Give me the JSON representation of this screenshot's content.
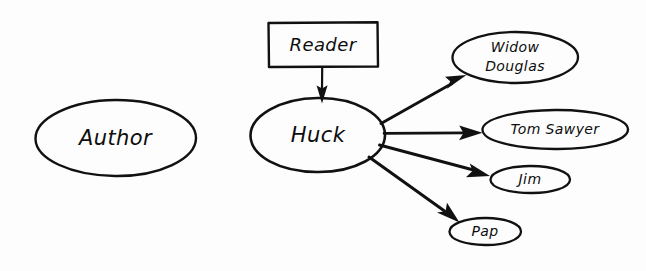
{
  "diagram": {
    "kind": "hand-drawn concept map",
    "background_color": "#fdfdfd",
    "ink_color": "#111111",
    "nodes": [
      {
        "id": "author",
        "label": "Author",
        "shape": "ellipse",
        "cx": 115.5,
        "cy": 138,
        "rx": 80,
        "ry": 38,
        "font_size": 21,
        "lines": [
          "Author"
        ]
      },
      {
        "id": "reader",
        "label": "Reader",
        "shape": "rectangle",
        "x": 268,
        "y": 22,
        "width": 110,
        "height": 45,
        "font_size": 18,
        "lines": [
          "Reader"
        ]
      },
      {
        "id": "huck",
        "label": "Huck",
        "shape": "ellipse",
        "cx": 317.5,
        "cy": 135,
        "rx": 67.5,
        "ry": 37,
        "font_size": 21,
        "lines": [
          "Huck"
        ]
      },
      {
        "id": "widow-douglas",
        "label": "Widow Douglas",
        "shape": "ellipse",
        "cx": 515,
        "cy": 57,
        "rx": 63,
        "ry": 26,
        "font_size": 14,
        "lines": [
          "Widow",
          "Douglas"
        ]
      },
      {
        "id": "tom-sawyer",
        "label": "Tom Sawyer",
        "shape": "ellipse",
        "cx": 555,
        "cy": 130,
        "rx": 73,
        "ry": 20,
        "font_size": 14,
        "lines": [
          "Tom Sawyer"
        ]
      },
      {
        "id": "jim",
        "label": "Jim",
        "shape": "ellipse",
        "cx": 530,
        "cy": 180,
        "rx": 40,
        "ry": 14,
        "font_size": 14,
        "lines": [
          "Jim"
        ]
      },
      {
        "id": "pap",
        "label": "Pap",
        "shape": "ellipse",
        "cx": 485,
        "cy": 232,
        "rx": 36,
        "ry": 14,
        "font_size": 14,
        "lines": [
          "Pap"
        ]
      }
    ],
    "edges": [
      {
        "id": "reader-to-huck",
        "from": "reader",
        "to": "huck",
        "label": "",
        "x1": 322,
        "y1": 67,
        "x2": 322,
        "y2": 101,
        "arrowhead": "filled-triangle"
      },
      {
        "id": "huck-to-widow-douglas",
        "from": "huck",
        "to": "widow-douglas",
        "label": "",
        "x1": 383,
        "y1": 123,
        "x2": 466,
        "y2": 76,
        "arrowhead": "filled-triangle"
      },
      {
        "id": "huck-to-tom-sawyer",
        "from": "huck",
        "to": "tom-sawyer",
        "label": "",
        "x1": 385,
        "y1": 133,
        "x2": 482,
        "y2": 133,
        "arrowhead": "filled-triangle"
      },
      {
        "id": "huck-to-jim",
        "from": "huck",
        "to": "jim",
        "label": "",
        "x1": 381,
        "y1": 146,
        "x2": 489,
        "y2": 176,
        "arrowhead": "filled-triangle"
      },
      {
        "id": "huck-to-pap",
        "from": "huck",
        "to": "pap",
        "label": "",
        "x1": 371,
        "y1": 158,
        "x2": 459,
        "y2": 223,
        "arrowhead": "filled-triangle"
      }
    ]
  }
}
